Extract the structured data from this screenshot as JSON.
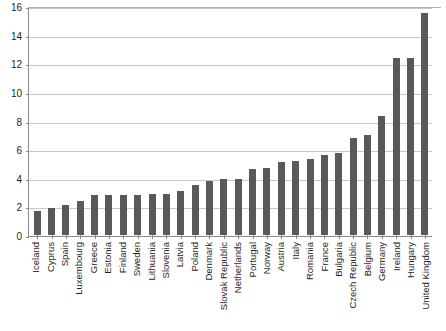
{
  "chart_data": {
    "type": "bar",
    "title": "",
    "xlabel": "",
    "ylabel": "",
    "ylim": [
      0,
      16
    ],
    "ytick_step": 2,
    "yticks": [
      0,
      2,
      4,
      6,
      8,
      10,
      12,
      14,
      16
    ],
    "grid": true,
    "legend": "none",
    "bar_color": "#595959",
    "gridline_color": "#c8c8c8",
    "axis_color": "#8a8a8a",
    "categories": [
      "Iceland",
      "Cyprus",
      "Spain",
      "Luxembourg",
      "Greece",
      "Estonia",
      "Finland",
      "Sweden",
      "Lithuania",
      "Slovenia",
      "Latvia",
      "Poland",
      "Denmark",
      "Slovak Republic",
      "Netherlands",
      "Portugal",
      "Norway",
      "Austria",
      "Italy",
      "Romania",
      "France",
      "Bulgaria",
      "Czech Republic",
      "Belgium",
      "Germany",
      "Ireland",
      "Hungary",
      "United Kingdom"
    ],
    "values": [
      1.7,
      1.9,
      2.1,
      2.4,
      2.8,
      2.8,
      2.8,
      2.8,
      2.9,
      2.9,
      3.1,
      3.5,
      3.8,
      3.9,
      3.9,
      4.6,
      4.7,
      5.1,
      5.2,
      5.3,
      5.6,
      5.7,
      6.8,
      7.0,
      8.3,
      12.4,
      12.4,
      15.5
    ]
  },
  "footer": {
    "source_note": ""
  }
}
